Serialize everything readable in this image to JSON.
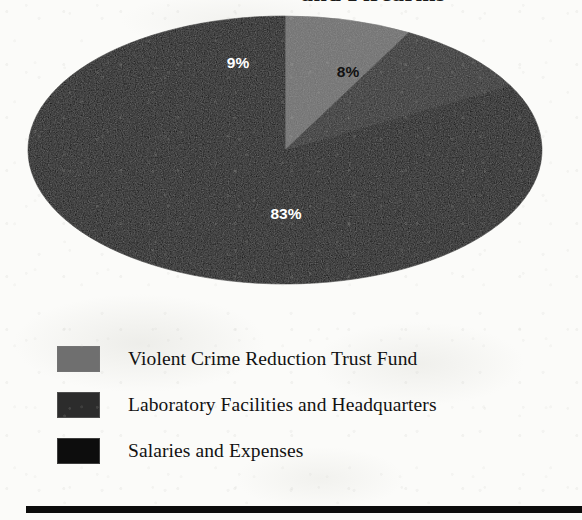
{
  "document": {
    "title_fragment": "and Firearms",
    "background_color": "#fbfbf9"
  },
  "chart_data": {
    "type": "pie",
    "title": "and Firearms",
    "categories": [
      "Violent Crime Reduction Trust Fund",
      "Laboratory Facilities and Headquarters",
      "Salaries and Expenses"
    ],
    "values": [
      8,
      9,
      83
    ],
    "value_labels": [
      "8%",
      "9%",
      "83%"
    ],
    "colors": [
      "#6f6f6f",
      "#2c2c2c",
      "#0d0d0d"
    ],
    "label_text_colors": [
      "#121212",
      "#ffffff",
      "#ffffff"
    ],
    "unit": "percent",
    "legend_position": "bottom-left",
    "style": "3d-flattened-ellipse",
    "grid": false,
    "xlabel": "",
    "ylabel": ""
  },
  "pie": {
    "center_x": 285,
    "center_y": 136,
    "radius_x": 257,
    "radius_y": 134,
    "start_angle_deg": -90,
    "slices": [
      {
        "name": "violent-crime-reduction-trust-fund",
        "percent": 8,
        "label": "8%",
        "fill": "#6f6f6f",
        "text_fill": "#121212",
        "label_x": 348,
        "label_y": 63
      },
      {
        "name": "laboratory-facilities-and-headquarters",
        "percent": 9,
        "label": "9%",
        "fill": "#2c2c2c",
        "text_fill": "#ffffff",
        "label_x": 238,
        "label_y": 54
      },
      {
        "name": "salaries-and-expenses",
        "percent": 83,
        "label": "83%",
        "fill": "#0d0d0d",
        "text_fill": "#ffffff",
        "label_x": 286,
        "label_y": 205
      }
    ]
  },
  "legend": {
    "items": [
      {
        "label": "Violent Crime Reduction Trust Fund",
        "color": "#6f6f6f"
      },
      {
        "label": "Laboratory Facilities and Headquarters",
        "color": "#2c2c2c"
      },
      {
        "label": "Salaries and Expenses",
        "color": "#0d0d0d"
      }
    ]
  },
  "footer": {
    "rule_color": "#0c0c0c"
  }
}
